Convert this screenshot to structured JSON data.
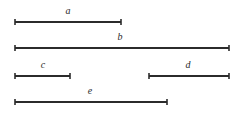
{
  "figure": {
    "type": "line-segment-diagram",
    "width": 245,
    "height": 114,
    "background_color": "#ffffff",
    "line_color": "#2b2b2b",
    "line_width": 2,
    "endpoint_cap": "tick-mark",
    "label_style": "italic-serif"
  },
  "segments": [
    {
      "label": "a",
      "x1": 15,
      "x2": 121,
      "y": 22,
      "length": 106,
      "label_x": 68,
      "label_y": 6
    },
    {
      "label": "b",
      "x1": 15,
      "x2": 229,
      "y": 48,
      "length": 214,
      "label_x": 120,
      "label_y": 32
    },
    {
      "label": "c",
      "x1": 15,
      "x2": 70,
      "y": 76,
      "length": 55,
      "label_x": 43,
      "label_y": 60
    },
    {
      "label": "d",
      "x1": 149,
      "x2": 229,
      "y": 76,
      "length": 80,
      "label_x": 188,
      "label_y": 60
    },
    {
      "label": "e",
      "x1": 15,
      "x2": 167,
      "y": 102,
      "length": 152,
      "label_x": 90,
      "label_y": 86
    }
  ]
}
